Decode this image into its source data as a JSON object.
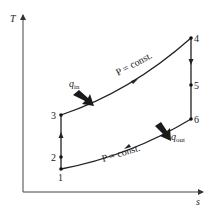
{
  "diagram": {
    "type": "T-s diagram (Brayton cycle with intercooling-free reheat path)",
    "axes": {
      "y_label": "T",
      "x_label": "s"
    },
    "states": [
      {
        "id": "1",
        "label": "1"
      },
      {
        "id": "2",
        "label": "2"
      },
      {
        "id": "3",
        "label": "3"
      },
      {
        "id": "4",
        "label": "4"
      },
      {
        "id": "5",
        "label": "5"
      },
      {
        "id": "6",
        "label": "6"
      }
    ],
    "annotations": {
      "top_curve": "P = const.",
      "bottom_curve": "P = const.",
      "heat_in": "q",
      "heat_in_sub": "in",
      "heat_out": "q",
      "heat_out_sub": "out"
    },
    "colors": {
      "line": "#222222",
      "arrow": "#1a1a1a",
      "background": "#ffffff"
    }
  }
}
